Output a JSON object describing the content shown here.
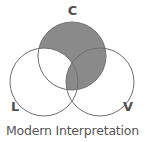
{
  "logo": {
    "tagline": "Modern Interpretation",
    "labels": {
      "top": "C",
      "bottom_left": "L",
      "bottom_right": "V"
    },
    "colors": {
      "fill_gray": "#8a8a8a",
      "stroke_gray": "#6e6e6e",
      "label_gray": "#4f4f4f",
      "tagline_gray": "#555555",
      "background": "#ffffff"
    },
    "geometry": {
      "circle_radius": 34,
      "top_circle_center": [
        72,
        56
      ],
      "left_circle_center": [
        44,
        82
      ],
      "right_circle_center": [
        100,
        82
      ],
      "stroke_width": 1
    }
  }
}
